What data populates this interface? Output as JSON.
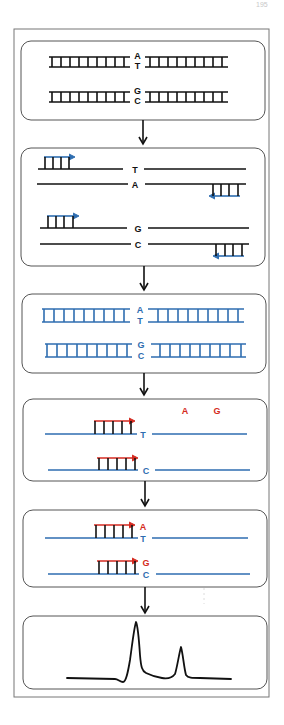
{
  "page_number": "195",
  "colors": {
    "frame": "#777777",
    "panel_border": "#555555",
    "dna_black": "#111111",
    "dna_blue": "#2e6db0",
    "primer_blue": "#2e6db0",
    "extension_red": "#d42a20",
    "arrow": "#111111",
    "trace": "#111111"
  },
  "panels": [
    {
      "id": "genomic-dna",
      "description": "Double-stranded DNA with SNP",
      "pairs": [
        {
          "top": "A",
          "bottom": "T"
        },
        {
          "top": "G",
          "bottom": "C"
        }
      ]
    },
    {
      "id": "pcr-primers",
      "description": "Denatured strands with PCR primers annealed",
      "pairs": [
        {
          "top": "T",
          "bottom": "A"
        },
        {
          "top": "G",
          "bottom": "C"
        }
      ]
    },
    {
      "id": "pcr-products",
      "description": "Amplified PCR products",
      "pairs": [
        {
          "top": "A",
          "bottom": "T"
        },
        {
          "top": "G",
          "bottom": "C"
        }
      ]
    },
    {
      "id": "extension-primers",
      "description": "Single-base extension primers with labeled nucleotides",
      "labels": [
        "A",
        "G"
      ],
      "templates": [
        "T",
        "C"
      ]
    },
    {
      "id": "single-base-extension",
      "description": "Primers extended by one labeled base",
      "pairs": [
        {
          "top": "A",
          "bottom": "T"
        },
        {
          "top": "G",
          "bottom": "C"
        }
      ]
    },
    {
      "id": "electropherogram",
      "description": "Detection trace with two peaks",
      "peaks": [
        {
          "x": 136,
          "relative_height": 1.0
        },
        {
          "x": 182,
          "relative_height": 0.55
        }
      ]
    }
  ]
}
